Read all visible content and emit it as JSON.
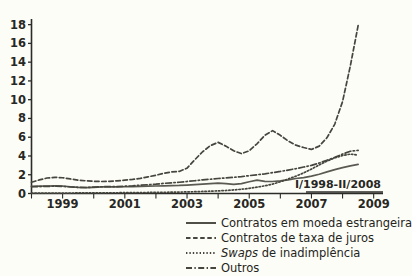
{
  "chart_data": {
    "type": "line",
    "title": "",
    "subtitle": "",
    "xlabel": "",
    "ylabel": "",
    "annotation": "I/1998-II/2008",
    "xlim": [
      1998.0,
      2009.3
    ],
    "ylim": [
      0,
      18.6
    ],
    "grid": false,
    "legend_position": "bottom-right",
    "y_ticks": [
      0,
      2,
      4,
      6,
      8,
      10,
      12,
      14,
      16,
      18
    ],
    "y_tick_labels": [
      "0",
      "2",
      "4",
      "6",
      "8",
      "10",
      "12",
      "14",
      "16",
      "18"
    ],
    "x_ticks": [
      1999,
      2001,
      2003,
      2005,
      2007,
      2009
    ],
    "x_tick_labels": [
      "1999",
      "2001",
      "2003",
      "2005",
      "2007",
      "2009"
    ],
    "x_minor_ticks": [
      1998,
      2000,
      2002,
      2004,
      2006,
      2008
    ],
    "x": [
      1998.0,
      1998.25,
      1998.5,
      1998.75,
      1999.0,
      1999.25,
      1999.5,
      1999.75,
      2000.0,
      2000.25,
      2000.5,
      2000.75,
      2001.0,
      2001.25,
      2001.5,
      2001.75,
      2002.0,
      2002.25,
      2002.5,
      2002.75,
      2003.0,
      2003.25,
      2003.5,
      2003.75,
      2004.0,
      2004.25,
      2004.5,
      2004.75,
      2005.0,
      2005.25,
      2005.5,
      2005.75,
      2006.0,
      2006.25,
      2006.5,
      2006.75,
      2007.0,
      2007.25,
      2007.5,
      2007.75,
      2008.0,
      2008.25,
      2008.5
    ],
    "series": [
      {
        "name": "Contratos em moeda estrangeira",
        "style": "solid",
        "values": [
          0.75,
          0.78,
          0.8,
          0.82,
          0.8,
          0.72,
          0.66,
          0.62,
          0.66,
          0.7,
          0.72,
          0.7,
          0.72,
          0.74,
          0.76,
          0.78,
          0.8,
          0.82,
          0.84,
          0.86,
          0.9,
          0.95,
          1.0,
          1.05,
          1.1,
          1.05,
          0.98,
          1.05,
          1.25,
          1.42,
          1.3,
          1.28,
          1.35,
          1.45,
          1.6,
          1.7,
          1.85,
          2.05,
          2.3,
          2.55,
          2.75,
          2.95,
          3.1
        ]
      },
      {
        "name": "Contratos de taxa de juros",
        "style": "dashed",
        "values": [
          1.2,
          1.45,
          1.65,
          1.72,
          1.68,
          1.55,
          1.42,
          1.35,
          1.3,
          1.28,
          1.3,
          1.35,
          1.42,
          1.5,
          1.62,
          1.78,
          1.95,
          2.15,
          2.3,
          2.35,
          2.7,
          3.6,
          4.45,
          5.1,
          5.45,
          5.05,
          4.55,
          4.25,
          4.55,
          5.3,
          6.2,
          6.7,
          6.2,
          5.6,
          5.15,
          4.9,
          4.7,
          5.05,
          5.95,
          7.4,
          9.8,
          13.6,
          17.9
        ]
      },
      {
        "name": "Swaps de inadimplência",
        "style": "dotted",
        "values": [
          0.05,
          0.05,
          0.05,
          0.05,
          0.05,
          0.05,
          0.06,
          0.06,
          0.07,
          0.07,
          0.08,
          0.08,
          0.09,
          0.1,
          0.1,
          0.11,
          0.12,
          0.13,
          0.14,
          0.15,
          0.17,
          0.19,
          0.22,
          0.25,
          0.28,
          0.32,
          0.38,
          0.45,
          0.55,
          0.68,
          0.82,
          1.0,
          1.25,
          1.55,
          1.85,
          2.2,
          2.6,
          3.05,
          3.45,
          3.8,
          4.05,
          4.2,
          4.1
        ]
      },
      {
        "name": "Outros",
        "style": "dashdot",
        "values": [
          0.72,
          0.74,
          0.76,
          0.78,
          0.76,
          0.7,
          0.66,
          0.64,
          0.68,
          0.72,
          0.74,
          0.74,
          0.78,
          0.82,
          0.88,
          0.94,
          1.0,
          1.08,
          1.14,
          1.2,
          1.28,
          1.36,
          1.45,
          1.52,
          1.6,
          1.66,
          1.72,
          1.8,
          1.9,
          2.0,
          2.1,
          2.22,
          2.35,
          2.5,
          2.65,
          2.82,
          3.0,
          3.25,
          3.55,
          3.85,
          4.2,
          4.5,
          4.6
        ]
      }
    ]
  },
  "legend": {
    "items": [
      {
        "label": "Contratos em moeda estrangeira",
        "style": "solid",
        "italic_prefix": ""
      },
      {
        "label": "Contratos de taxa de juros",
        "style": "dashed",
        "italic_prefix": ""
      },
      {
        "label": "de inadimplência",
        "style": "dotted",
        "italic_prefix": "Swaps"
      },
      {
        "label": "Outros",
        "style": "dashdot",
        "italic_prefix": ""
      }
    ]
  },
  "colors": {
    "background": "#fdfdf7",
    "axis": "#2b2b28",
    "line": "#46463f",
    "text": "#242421"
  }
}
